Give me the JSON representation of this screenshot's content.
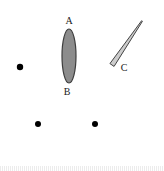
{
  "figure": {
    "title": "",
    "width": 164,
    "height": 171,
    "background_color": "#ffffff",
    "labels": {
      "a": "A",
      "b": "B",
      "c": "C"
    },
    "shapes": [
      {
        "name": "ellipse-ab",
        "kind": "ellipse",
        "label_top": "A",
        "label_bottom": "B",
        "center_x": 69,
        "center_y": 56,
        "radius_x": 7,
        "radius_y": 27,
        "fill_color": "#8c8c8c",
        "stroke_color": "#3d3d3d",
        "stroke_width": 1.2
      },
      {
        "name": "sliver-c",
        "kind": "tapered-sliver",
        "label": "C",
        "start_x": 112,
        "start_y": 65,
        "end_x": 142,
        "end_y": 21,
        "width_start": 5,
        "width_end": 1,
        "fill_color": "#cccccc",
        "stroke_color": "#444444",
        "stroke_width": 1
      }
    ],
    "dots": [
      {
        "name": "dot-left",
        "x": 20,
        "y": 67,
        "radius": 3.2,
        "color": "#000000"
      },
      {
        "name": "dot-bottom-left",
        "x": 38,
        "y": 124,
        "radius": 3.0,
        "color": "#000000"
      },
      {
        "name": "dot-bottom-right",
        "x": 95,
        "y": 124,
        "radius": 3.0,
        "color": "#000000"
      }
    ],
    "label_positions": {
      "a": {
        "x": 69,
        "y": 21
      },
      "b": {
        "x": 67,
        "y": 92
      },
      "c": {
        "x": 124,
        "y": 68
      }
    },
    "colors": {
      "ellipse_fill": "#8c8c8c",
      "ellipse_stroke": "#3d3d3d",
      "sliver_fill": "#cccccc",
      "sliver_stroke": "#444444",
      "dot": "#000000",
      "text": "#1a1a1a",
      "background": "#ffffff",
      "footer_strip": "#e9e9e9"
    }
  }
}
